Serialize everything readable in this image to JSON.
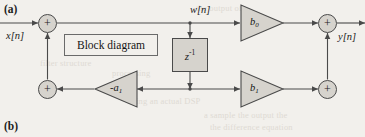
{
  "figure": {
    "part_a_label": "(a)",
    "part_b_label": "(b)",
    "caption_box_text": "Block diagram",
    "type": "direct-form-II IIR filter block diagram"
  },
  "signals": {
    "input_label": "x[n]",
    "state_label": "w[n]",
    "output_label": "y[n]"
  },
  "blocks": {
    "delay": {
      "base": "z",
      "exponent": "-1",
      "full": "z-1"
    }
  },
  "gains": [
    {
      "name": "b0",
      "base": "b",
      "sub": "0",
      "prefix": "",
      "direction": "right"
    },
    {
      "name": "b1",
      "base": "b",
      "sub": "1",
      "prefix": "",
      "direction": "right"
    },
    {
      "name": "a1",
      "base": "a",
      "sub": "1",
      "prefix": "-",
      "direction": "left"
    }
  ],
  "adders": {
    "input_sum": "+",
    "output_sum": "+",
    "feedback_sum": "+",
    "feedforward_sum": "+"
  },
  "ghost_text": [
    {
      "text": "the output of",
      "x": 196,
      "y": 3
    },
    {
      "text": "filter structure",
      "x": 40,
      "y": 58
    },
    {
      "text": "processing",
      "x": 112,
      "y": 68
    },
    {
      "text": "using an actual DSP",
      "x": 128,
      "y": 96
    },
    {
      "text": "a sample the output the",
      "x": 204,
      "y": 110
    },
    {
      "text": "the difference equation",
      "x": 210,
      "y": 122
    }
  ],
  "colors": {
    "page_background": "#f2f0ec",
    "block_fill": "#d6d3cd",
    "stroke": "#4a4a4a",
    "text": "#1a1a1a",
    "ghost": "#cfc9c0"
  }
}
